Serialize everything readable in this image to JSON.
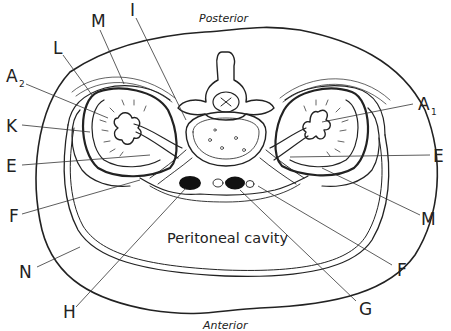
{
  "diagram": {
    "orientation": {
      "top": "Posterior",
      "bottom": "Anterior"
    },
    "region_label": "Peritoneal cavity",
    "labels": [
      {
        "id": "I",
        "text": "I",
        "sub": ""
      },
      {
        "id": "M_left",
        "text": "M",
        "sub": ""
      },
      {
        "id": "L",
        "text": "L",
        "sub": ""
      },
      {
        "id": "A2",
        "text": "A",
        "sub": "2"
      },
      {
        "id": "K",
        "text": "K",
        "sub": ""
      },
      {
        "id": "E_left",
        "text": "E",
        "sub": ""
      },
      {
        "id": "F_left",
        "text": "F",
        "sub": ""
      },
      {
        "id": "N",
        "text": "N",
        "sub": ""
      },
      {
        "id": "H",
        "text": "H",
        "sub": ""
      },
      {
        "id": "G",
        "text": "G",
        "sub": ""
      },
      {
        "id": "F_right",
        "text": "F",
        "sub": ""
      },
      {
        "id": "M_right",
        "text": "M",
        "sub": ""
      },
      {
        "id": "E_right",
        "text": "E",
        "sub": ""
      },
      {
        "id": "A1",
        "text": "A",
        "sub": "1"
      }
    ]
  }
}
